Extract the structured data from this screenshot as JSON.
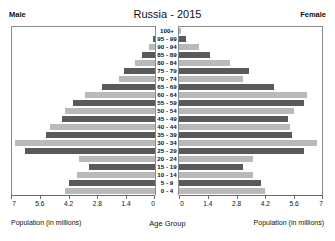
{
  "header": {
    "title": "Russia - 2015",
    "male_label": "Male",
    "female_label": "Female"
  },
  "captions": {
    "male_axis": "Population (in millions)",
    "female_axis": "Population (in millions)",
    "center_axis": "Age Group"
  },
  "colors": {
    "bar_light": "#b9b9b9",
    "bar_dark": "#5a5a5a",
    "axis": "#6b6b6b",
    "border": "#8a8a8a",
    "text": "#111111",
    "background": "#ffffff"
  },
  "chart_data": {
    "type": "bar",
    "subtype": "population-pyramid",
    "title": "Russia - 2015",
    "xlabel": "Population (in millions)",
    "ylabel": "Age Group",
    "grid": false,
    "legend": false,
    "xlim": [
      0,
      7
    ],
    "xticks": [
      7,
      5.6,
      4.2,
      2.8,
      1.4,
      0
    ],
    "xticks_left_order": [
      "7",
      "5.6",
      "4.2",
      "2.8",
      "1.4",
      "0"
    ],
    "xticks_right_order": [
      "0",
      "1.4",
      "2.8",
      "4.2",
      "5.6",
      "7"
    ],
    "categories": [
      "100+",
      "95 - 99",
      "90 - 94",
      "85 - 89",
      "80 - 84",
      "75 - 79",
      "70 - 74",
      "65 - 69",
      "60 - 64",
      "55 - 59",
      "50 - 54",
      "45 - 49",
      "40 - 44",
      "35 - 39",
      "30 - 34",
      "25 - 29",
      "20 - 24",
      "15 - 19",
      "10 - 14",
      "5 - 9",
      "0 - 4"
    ],
    "series": [
      {
        "name": "Male",
        "side": "left",
        "values": [
          0.02,
          0.1,
          0.3,
          0.65,
          0.95,
          1.5,
          1.75,
          2.6,
          3.4,
          4.0,
          4.4,
          4.5,
          5.1,
          5.3,
          6.8,
          6.3,
          3.7,
          3.2,
          3.8,
          4.2,
          4.4
        ]
      },
      {
        "name": "Female",
        "side": "right",
        "values": [
          0.08,
          0.35,
          0.95,
          1.5,
          2.5,
          3.4,
          3.1,
          4.6,
          6.2,
          6.1,
          5.6,
          5.3,
          5.4,
          5.5,
          6.7,
          6.1,
          3.6,
          3.1,
          3.6,
          4.0,
          4.2
        ]
      }
    ]
  }
}
